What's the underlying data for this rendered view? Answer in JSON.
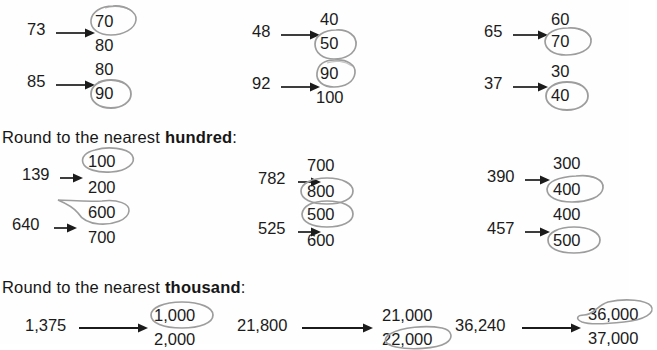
{
  "page": {
    "background_color": "#fefefe",
    "ink_color": "#1b1b1b",
    "pencil_color": "#9a9a9a"
  },
  "sections": [
    {
      "id": "tens",
      "heading": "",
      "heading_bold": "",
      "heading_suffix": "",
      "problems": [
        {
          "value": "73",
          "top": "70",
          "bottom": "80",
          "circled": "top"
        },
        {
          "value": "48",
          "top": "40",
          "bottom": "50",
          "circled": "bottom"
        },
        {
          "value": "65",
          "top": "60",
          "bottom": "70",
          "circled": "bottom"
        },
        {
          "value": "85",
          "top": "80",
          "bottom": "90",
          "circled": "bottom"
        },
        {
          "value": "92",
          "top": "90",
          "bottom": "100",
          "circled": "top"
        },
        {
          "value": "37",
          "top": "30",
          "bottom": "40",
          "circled": "bottom"
        }
      ]
    },
    {
      "id": "hundreds",
      "heading": "Round to the nearest ",
      "heading_bold": "hundred",
      "heading_suffix": ":",
      "problems": [
        {
          "value": "139",
          "top": "100",
          "bottom": "200",
          "circled": "top"
        },
        {
          "value": "782",
          "top": "700",
          "bottom": "800",
          "circled": "bottom"
        },
        {
          "value": "390",
          "top": "300",
          "bottom": "400",
          "circled": "bottom"
        },
        {
          "value": "640",
          "top": "600",
          "bottom": "700",
          "circled": "top"
        },
        {
          "value": "525",
          "top": "500",
          "bottom": "600",
          "circled": "top"
        },
        {
          "value": "457",
          "top": "400",
          "bottom": "500",
          "circled": "bottom"
        }
      ]
    },
    {
      "id": "thousands",
      "heading": "Round to the nearest ",
      "heading_bold": "thousand",
      "heading_suffix": ":",
      "problems": [
        {
          "value": "1,375",
          "top": "1,000",
          "bottom": "2,000",
          "circled": "top"
        },
        {
          "value": "21,800",
          "top": "21,000",
          "bottom": "22,000",
          "circled": "bottom"
        },
        {
          "value": "36,240",
          "top": "36,000",
          "bottom": "37,000",
          "circled": "top"
        }
      ]
    }
  ],
  "headings": {
    "hundreds_prefix": "Round to the nearest ",
    "hundreds_bold": "hundred",
    "hundreds_suffix": ":",
    "thousands_prefix": "Round to the nearest ",
    "thousands_bold": "thousand",
    "thousands_suffix": ":"
  },
  "items": {
    "p1": {
      "value": "73",
      "top": "70",
      "bottom": "80"
    },
    "p2": {
      "value": "48",
      "top": "40",
      "bottom": "50"
    },
    "p3": {
      "value": "65",
      "top": "60",
      "bottom": "70"
    },
    "p4": {
      "value": "85",
      "top": "80",
      "bottom": "90"
    },
    "p5": {
      "value": "92",
      "top": "90",
      "bottom": "100"
    },
    "p6": {
      "value": "37",
      "top": "30",
      "bottom": "40"
    },
    "p7": {
      "value": "139",
      "top": "100",
      "bottom": "200"
    },
    "p8": {
      "value": "782",
      "top": "700",
      "bottom": "800"
    },
    "p9": {
      "value": "390",
      "top": "300",
      "bottom": "400"
    },
    "p10": {
      "value": "640",
      "top": "600",
      "bottom": "700"
    },
    "p11": {
      "value": "525",
      "top": "500",
      "bottom": "600"
    },
    "p12": {
      "value": "457",
      "top": "400",
      "bottom": "500"
    },
    "p13": {
      "value": "1,375",
      "top": "1,000",
      "bottom": "2,000"
    },
    "p14": {
      "value": "21,800",
      "top": "21,000",
      "bottom": "22,000"
    },
    "p15": {
      "value": "36,240",
      "top": "36,000",
      "bottom": "37,000"
    }
  }
}
